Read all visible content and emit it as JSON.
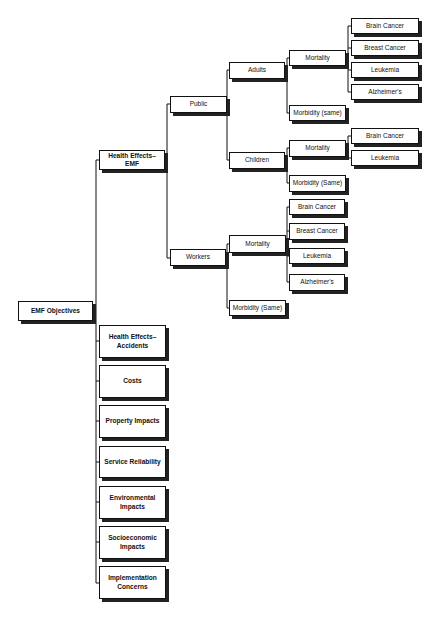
{
  "diagram": {
    "type": "objectives-hierarchy-tree",
    "root": "EMF Objectives",
    "colors": {
      "line": "#111111",
      "box_fill": "#ffffff",
      "shadow": "#222222"
    },
    "nodes": {
      "emf_objectives": "EMF Objectives",
      "health_effects_emf": "Health Effects–EMF",
      "public": "Public",
      "adults": "Adults",
      "adults_mortality": "Mortality",
      "adults_mortality_brain": "Brain Cancer",
      "adults_mortality_breast": "Breast Cancer",
      "adults_mortality_leukemia": "Leukemia",
      "adults_mortality_alzheimers": "Alzheimer's",
      "adults_morbidity": "Morbidity (same)",
      "children": "Children",
      "children_mortality": "Mortality",
      "children_mortality_brain": "Brain Cancer",
      "children_mortality_leukemia": "Leukemia",
      "children_morbidity": "Morbidity (Same)",
      "workers": "Workers",
      "workers_mortality": "Mortality",
      "workers_mortality_brain": "Brain Cancer",
      "workers_mortality_breast": "Breast Cancer",
      "workers_mortality_leukemia": "Leukemia",
      "workers_mortality_alzheimers": "Alzheimer's",
      "workers_morbidity": "Morbidity (Same)",
      "health_effects_accidents": "Health Effects–Accidents",
      "costs": "Costs",
      "property_impacts": "Property Impacts",
      "service_reliability": "Service Reliability",
      "environmental_impacts": "Environmental Impacts",
      "socioeconomic_impacts": "Socioeconomic Impacts",
      "implementation_concerns": "Implementation Concerns"
    }
  }
}
